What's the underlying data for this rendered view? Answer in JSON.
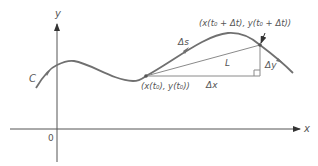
{
  "diagram": {
    "colors": {
      "curve": "#707070",
      "axis": "#555555",
      "chord": "#8a8a8a",
      "text": "#555555"
    },
    "axes": {
      "x_label": "x",
      "y_label": "y",
      "origin_label": "0"
    },
    "labels": {
      "curve_name": "C",
      "arc": "Δs",
      "chord": "L",
      "dx": "Δx",
      "dy": "Δy",
      "point_start": "(x(t₀), y(t₀))",
      "point_end": "(x(t₀ + Δt), y(t₀ + Δt))"
    }
  }
}
